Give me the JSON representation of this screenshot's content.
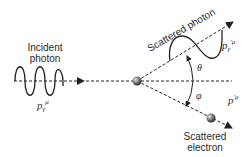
{
  "diagram": {
    "labels": {
      "incident_line1": "Incident",
      "incident_line2": "photon",
      "incident_momentum": "p",
      "incident_momentum_sub": "γ",
      "incident_momentum_sup": "μ",
      "scattered_photon": "Scattered photon",
      "scattered_photon_momentum": "p",
      "scattered_photon_momentum_sub": "γ",
      "scattered_photon_momentum_sup": "′μ",
      "theta": "θ",
      "phi": "φ",
      "scattered_electron_momentum": "p",
      "scattered_electron_momentum_sup": "′μ",
      "scattered_electron_line1": "Scattered",
      "scattered_electron_line2": "electron"
    },
    "colors": {
      "line": "#222222",
      "sphere_light": "#d8d8d8",
      "sphere_dark": "#3a3a3a"
    }
  }
}
